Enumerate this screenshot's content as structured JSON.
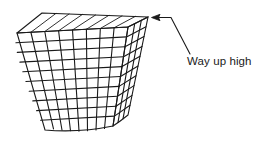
{
  "figure": {
    "title": "",
    "type": "wireframe-mesh-diagram",
    "background_color": "#ffffff",
    "line_color": "#1a1a1a",
    "annotation": {
      "label": "Way up high",
      "text_color": "#1a1a1a",
      "arrow_head": "left-pointing",
      "leader_line": "from text up-left to arrow tip at top-right corner of mesh"
    },
    "shape": {
      "name": "tapered-box-mesh",
      "description": "Truncated-pyramid / bucket shaped wireframe, wide flat top parallelogram, narrowing toward the bottom with a slightly curved base",
      "faces": [
        "top",
        "front",
        "right-side"
      ],
      "front_grid_columns": 8,
      "front_grid_rows": 10,
      "side_grid_columns": 3,
      "side_grid_rows": 10
    },
    "geometry": {
      "top_face": {
        "front_left": [
          17,
          33
        ],
        "front_right": [
          128,
          27
        ],
        "back_right": [
          148,
          17
        ],
        "back_left": [
          42,
          13
        ]
      },
      "front_face": {
        "top_left": [
          17,
          33
        ],
        "top_right": [
          128,
          27
        ],
        "bottom_right": [
          113,
          126
        ],
        "bottom_left": [
          45,
          130
        ]
      },
      "right_face": {
        "top_front": [
          128,
          27
        ],
        "top_back": [
          148,
          17
        ],
        "bottom_back": [
          128,
          115
        ],
        "bottom_front": [
          113,
          126
        ]
      },
      "arrow_tip": [
        152,
        17
      ],
      "arrow_elbow": [
        172,
        17
      ],
      "leader_end": [
        190,
        55
      ]
    }
  }
}
